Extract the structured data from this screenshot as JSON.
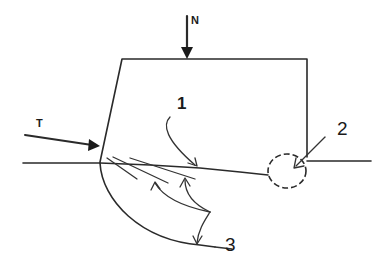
{
  "diagram": {
    "title": "",
    "labels": {
      "normal_force": "N",
      "tangential_force": "T",
      "callout_1": "1",
      "callout_2": "2",
      "callout_3": "3"
    },
    "elements": {
      "body": "trapezoidal block resting on surface line",
      "force_N": "vertical arrow pointing down onto top edge",
      "force_T": "inclined arrow pointing at left base corner",
      "crack_lines": "multiple oblique lines from left corner",
      "contact_zone": "dashed circle at right base corner",
      "arc": "curved boundary below surface from left corner"
    }
  }
}
